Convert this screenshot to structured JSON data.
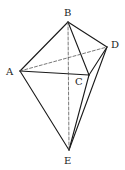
{
  "diagram": {
    "type": "geometric-solid",
    "vertices": [
      {
        "id": "A",
        "label": "A",
        "x": 20,
        "y": 71,
        "lx": 6,
        "ly": 75
      },
      {
        "id": "B",
        "label": "B",
        "x": 68,
        "y": 22,
        "lx": 64,
        "ly": 16
      },
      {
        "id": "C",
        "label": "C",
        "x": 89,
        "y": 75,
        "lx": 75,
        "ly": 85
      },
      {
        "id": "D",
        "label": "D",
        "x": 107,
        "y": 47,
        "lx": 111,
        "ly": 48
      },
      {
        "id": "E",
        "label": "E",
        "x": 69,
        "y": 150,
        "lx": 64,
        "ly": 164
      }
    ],
    "edges": [
      {
        "from": "A",
        "to": "B",
        "style": "solid"
      },
      {
        "from": "B",
        "to": "D",
        "style": "solid"
      },
      {
        "from": "B",
        "to": "C",
        "style": "solid"
      },
      {
        "from": "A",
        "to": "C",
        "style": "solid"
      },
      {
        "from": "C",
        "to": "D",
        "style": "solid"
      },
      {
        "from": "A",
        "to": "E",
        "style": "solid"
      },
      {
        "from": "C",
        "to": "E",
        "style": "solid"
      },
      {
        "from": "D",
        "to": "E",
        "style": "solid"
      },
      {
        "from": "A",
        "to": "D",
        "style": "dashed"
      },
      {
        "from": "B",
        "to": "E",
        "style": "dashed"
      }
    ]
  }
}
